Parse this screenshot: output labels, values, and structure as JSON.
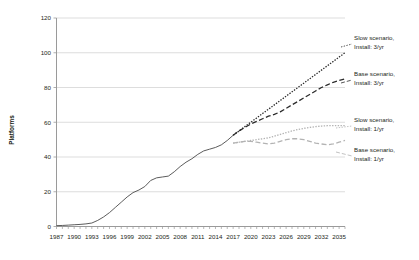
{
  "chart_data": {
    "type": "line",
    "title": "",
    "xlabel": "",
    "ylabel": "Platforms",
    "ylim": [
      0,
      120
    ],
    "yticks": [
      0,
      20,
      40,
      60,
      80,
      100,
      120
    ],
    "xlim": [
      1987,
      2036
    ],
    "xticks": [
      1987,
      1990,
      1993,
      1996,
      1999,
      2002,
      2005,
      2008,
      2011,
      2014,
      2017,
      2020,
      2023,
      2026,
      2029,
      2032,
      2035
    ],
    "grid": "horizontal",
    "legend_position": "right-inline-labels",
    "series": [
      {
        "name": "Slow scenario, Install: 3/yr",
        "label_line1": "Slow scenario,",
        "label_line2": "Install: 3/yr",
        "style": "dotted",
        "color": "#2b2b2b",
        "x": [
          2017,
          2018,
          2019,
          2020,
          2021,
          2022,
          2023,
          2024,
          2025,
          2026,
          2027,
          2028,
          2029,
          2030,
          2031,
          2032,
          2033,
          2034,
          2035,
          2036
        ],
        "values": [
          52.5,
          55.0,
          57.5,
          60.0,
          62.5,
          65.0,
          67.5,
          70.0,
          72.5,
          75.0,
          77.5,
          80.0,
          82.5,
          85.0,
          87.5,
          90.0,
          92.5,
          95.0,
          97.5,
          100.0
        ]
      },
      {
        "name": "Base scenario, Install: 3/yr",
        "label_line1": "Base scenario,",
        "label_line2": "Install: 3/yr",
        "style": "dashed",
        "color": "#2b2b2b",
        "x": [
          2017,
          2018,
          2019,
          2020,
          2021,
          2022,
          2023,
          2024,
          2025,
          2026,
          2027,
          2028,
          2029,
          2030,
          2031,
          2032,
          2033,
          2034,
          2035,
          2036
        ],
        "values": [
          52.5,
          55.0,
          57.0,
          59.0,
          60.5,
          62.0,
          63.5,
          64.5,
          66.0,
          68.0,
          70.0,
          72.0,
          74.0,
          76.0,
          78.0,
          80.0,
          81.5,
          83.0,
          84.0,
          85.0
        ]
      },
      {
        "name": "Slow scenario, Install: 1/yr",
        "label_line1": "Slow scenario,",
        "label_line2": "Install: 1/yr",
        "style": "dotted",
        "color": "#b3b3b3",
        "x": [
          2017,
          2018,
          2019,
          2020,
          2021,
          2022,
          2023,
          2024,
          2025,
          2026,
          2027,
          2028,
          2029,
          2030,
          2031,
          2032,
          2033,
          2034,
          2035,
          2036
        ],
        "values": [
          48.0,
          48.5,
          49.0,
          49.5,
          50.0,
          50.5,
          51.0,
          52.0,
          53.0,
          54.0,
          55.0,
          55.8,
          56.5,
          57.0,
          57.5,
          57.8,
          58.0,
          58.0,
          58.0,
          58.0
        ]
      },
      {
        "name": "Base scenario, Install: 1/yr",
        "label_line1": "Base scenario,",
        "label_line2": "Install: 1/yr",
        "style": "dashed",
        "color": "#b3b3b3",
        "x": [
          2017,
          2018,
          2019,
          2020,
          2021,
          2022,
          2023,
          2024,
          2025,
          2026,
          2027,
          2028,
          2029,
          2030,
          2031,
          2032,
          2033,
          2034,
          2035,
          2036
        ],
        "values": [
          48.0,
          48.5,
          49.0,
          49.0,
          48.5,
          48.0,
          47.5,
          48.0,
          49.0,
          50.0,
          50.5,
          50.5,
          50.0,
          49.0,
          48.0,
          47.5,
          47.0,
          47.5,
          48.5,
          49.5
        ]
      },
      {
        "name": "Historical",
        "label_line1": "",
        "label_line2": "",
        "style": "solid",
        "color": "#4a4a4a",
        "x": [
          1987,
          1988,
          1989,
          1990,
          1991,
          1992,
          1993,
          1994,
          1995,
          1996,
          1997,
          1998,
          1999,
          2000,
          2001,
          2002,
          2003,
          2004,
          2005,
          2006,
          2007,
          2008,
          2009,
          2010,
          2011,
          2012,
          2013,
          2014,
          2015,
          2016,
          2017
        ],
        "values": [
          0.5,
          0.6,
          0.8,
          1.0,
          1.2,
          1.5,
          2.0,
          3.5,
          5.5,
          8.0,
          11.0,
          14.0,
          17.0,
          19.5,
          21.0,
          23.0,
          26.5,
          28.0,
          28.5,
          29.0,
          31.5,
          34.5,
          37.0,
          39.0,
          41.5,
          43.5,
          44.5,
          45.5,
          47.0,
          49.5,
          52.5
        ]
      }
    ]
  },
  "axis": {
    "y_title": "Platforms",
    "y_tick_labels": [
      "120",
      "100",
      "80",
      "60",
      "40",
      "20",
      "0"
    ],
    "x_tick_labels": [
      "1987",
      "1990",
      "1993",
      "1996",
      "1999",
      "2002",
      "2005",
      "2008",
      "2011",
      "2014",
      "2017",
      "2020",
      "2023",
      "2026",
      "2029",
      "2032",
      "2035"
    ]
  },
  "legend": {
    "items": [
      {
        "line1": "Slow scenario,",
        "line2": "Install: 3/yr",
        "color": "#2b2b2b",
        "style": "dotted"
      },
      {
        "line1": "Base scenario,",
        "line2": "Install: 3/yr",
        "color": "#2b2b2b",
        "style": "dashed"
      },
      {
        "line1": "Slow scenario,",
        "line2": "Install: 1/yr",
        "color": "#b3b3b3",
        "style": "dotted"
      },
      {
        "line1": "Base scenario,",
        "line2": "Install: 1/yr",
        "color": "#b3b3b3",
        "style": "dashed"
      }
    ]
  }
}
